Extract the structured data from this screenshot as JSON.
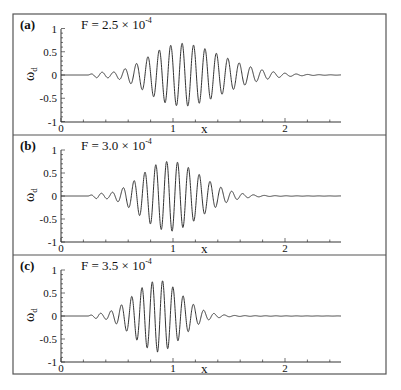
{
  "figure": {
    "outer_frame": {
      "left": 13,
      "top": 14,
      "right": 386,
      "bottom": 374
    },
    "line_color": "#333333",
    "frame_color": "#555555"
  },
  "chart_data": [
    {
      "type": "line",
      "panel_label": "(a)",
      "title": "F = 2.5 × 10",
      "title_exponent": "-4",
      "xlabel": "x",
      "ylabel": "ω",
      "ylabel_subscript": "d",
      "xlim": [
        0,
        2.5
      ],
      "ylim": [
        -1,
        1
      ],
      "xticks": [
        "0",
        "1",
        "2"
      ],
      "yticks": [
        "1",
        "0.5",
        "0",
        "-0.5",
        "-1"
      ],
      "series": [
        {
          "name": "omega_d",
          "onset": 0.24,
          "peak_x": 1.05,
          "peak_amp": 0.66,
          "rise_width": 0.38,
          "decay_width": 0.55,
          "wavelength": 0.102,
          "end_x": 2.5
        }
      ]
    },
    {
      "type": "line",
      "panel_label": "(b)",
      "title": "F = 3.0 × 10",
      "title_exponent": "-4",
      "xlabel": "x",
      "ylabel": "ω",
      "ylabel_subscript": "d",
      "xlim": [
        0,
        2.5
      ],
      "ylim": [
        -1,
        1
      ],
      "xticks": [
        "0",
        "1",
        "2"
      ],
      "yticks": [
        "1",
        "0.5",
        "0",
        "-0.5",
        "-1"
      ],
      "series": [
        {
          "name": "omega_d",
          "onset": 0.24,
          "peak_x": 0.95,
          "peak_amp": 0.75,
          "rise_width": 0.33,
          "decay_width": 0.4,
          "wavelength": 0.097,
          "end_x": 2.5
        }
      ]
    },
    {
      "type": "line",
      "panel_label": "(c)",
      "title": "F = 3.5 × 10",
      "title_exponent": "-4",
      "xlabel": "x",
      "ylabel": "ω",
      "ylabel_subscript": "d",
      "xlim": [
        0,
        2.5
      ],
      "ylim": [
        -1,
        1
      ],
      "xticks": [
        "0",
        "1",
        "2"
      ],
      "yticks": [
        "1",
        "0.5",
        "0",
        "-0.5",
        "-1"
      ],
      "series": [
        {
          "name": "omega_d",
          "onset": 0.24,
          "peak_x": 0.86,
          "peak_amp": 0.76,
          "rise_width": 0.3,
          "decay_width": 0.3,
          "wavelength": 0.092,
          "end_x": 2.5
        }
      ]
    }
  ],
  "layout": {
    "panels": [
      {
        "top": 14,
        "bottom": 135,
        "y_top": 29,
        "y_zero": 75,
        "y_bottom": 122
      },
      {
        "top": 135,
        "bottom": 255,
        "y_top": 150,
        "y_zero": 196,
        "y_bottom": 242
      },
      {
        "top": 255,
        "bottom": 374,
        "y_top": 270,
        "y_zero": 316,
        "y_bottom": 362
      }
    ],
    "x0_px": 61,
    "px_per_unit": 112
  }
}
